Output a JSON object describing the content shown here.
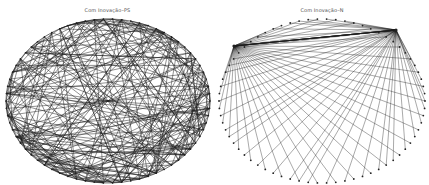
{
  "figure": {
    "panels": [
      {
        "id": "ps",
        "title": "Com Inovação–PS",
        "layout": "circular",
        "node_count": 70,
        "center": [
          108,
          101
        ],
        "radius": [
          102,
          82
        ],
        "edge_style": "dense random network",
        "edge_color": "#1a1a1a",
        "edge_count": 260
      },
      {
        "id": "n",
        "title": "Com Inovação–N",
        "layout": "circular",
        "node_count": 70,
        "center": [
          107,
          101
        ],
        "radius": [
          103,
          82
        ],
        "edge_style": "two hubs connected to peripheral nodes",
        "edge_color": "#1a1a1a",
        "hubs": [
          [
            19,
            46
          ],
          [
            181,
            30
          ]
        ]
      }
    ]
  }
}
